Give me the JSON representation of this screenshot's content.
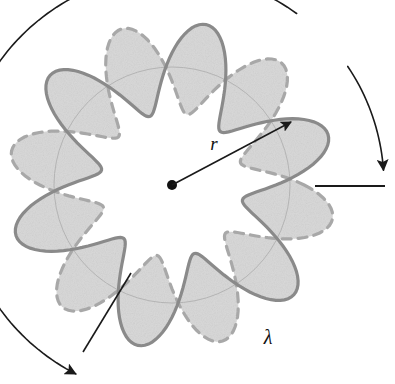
{
  "figure": {
    "canvas": {
      "width": 395,
      "height": 384,
      "background": "#ffffff"
    },
    "geometry": {
      "center": {
        "x": 172,
        "y": 185
      },
      "base_radius": 118,
      "lobe_count": 6,
      "node_count": 6,
      "wave_amplitude": 46,
      "phase_offset_deg": 27,
      "node_positions": [
        {
          "x": 110,
          "y": 78
        },
        {
          "x": 243,
          "y": 78
        },
        {
          "x": 307,
          "y": 182
        },
        {
          "x": 238,
          "y": 288
        },
        {
          "x": 110,
          "y": 292
        },
        {
          "x": 43,
          "y": 186
        }
      ]
    },
    "colors": {
      "solid_wave": "#8a8a8a",
      "dashed_wave": "#a8a8a8",
      "lobe_fill": "#d9d9d9",
      "base_circle": "#b4b4b4",
      "annotation": "#1a1a1a",
      "center_dot": "#111111",
      "background": "#ffffff"
    },
    "strokes": {
      "solid_wave_width": 3.2,
      "dashed_wave_width": 3.2,
      "dash_pattern": "9 7",
      "base_circle_width": 1.0,
      "annotation_width": 1.6
    }
  },
  "annotations": {
    "radius": {
      "label": "r",
      "name": "radius",
      "meaning": "orbit radius",
      "arrow_from": {
        "x": 172,
        "y": 185
      },
      "arrow_to": {
        "x": 291,
        "y": 122
      },
      "label_pos": {
        "x": 214,
        "y": 150
      }
    },
    "wavelength": {
      "label": "λ",
      "name": "lambda",
      "meaning": "de Broglie wavelength",
      "label_pos": {
        "x": 268,
        "y": 344
      },
      "arc_start": {
        "x": 96,
        "y": 338
      },
      "arc_end": {
        "x": 345,
        "y": 190
      },
      "tick_left": {
        "x1": 83,
        "y1": 352,
        "x2": 131,
        "y2": 273
      },
      "tick_right": {
        "x1": 315,
        "y1": 186,
        "x2": 385,
        "y2": 186
      }
    }
  },
  "center_dot": {
    "label": "orbit-center",
    "radius": 5
  },
  "caption": {
    "text": "",
    "visible": false
  },
  "chart_data": {
    "type": "line",
    "xlabel": "angle (degrees)",
    "ylabel": "radial displacement (px)",
    "grid": false,
    "legend_position": "none",
    "xlim": [
      0,
      360
    ],
    "ylim": [
      -46,
      46
    ],
    "x": [
      0,
      15,
      30,
      45,
      60,
      75,
      90,
      105,
      120,
      135,
      150,
      165,
      180,
      195,
      210,
      225,
      240,
      255,
      270,
      285,
      300,
      315,
      330,
      345,
      360
    ],
    "series": [
      {
        "name": "solid-phase",
        "style": "solid",
        "color": "#8a8a8a",
        "values": [
          0,
          23,
          39.8,
          46,
          39.8,
          23,
          0,
          -23,
          -39.8,
          -46,
          -39.8,
          -23,
          0,
          23,
          39.8,
          46,
          39.8,
          23,
          0,
          -23,
          -39.8,
          -46,
          -39.8,
          -23,
          0
        ]
      },
      {
        "name": "dashed-phase",
        "style": "dashed",
        "color": "#a8a8a8",
        "values": [
          0,
          -23,
          -39.8,
          -46,
          -39.8,
          -23,
          0,
          23,
          39.8,
          46,
          39.8,
          23,
          0,
          -23,
          -39.8,
          -46,
          -39.8,
          -23,
          0,
          23,
          39.8,
          46,
          39.8,
          23,
          0
        ]
      }
    ],
    "annotations": [
      {
        "label": "r",
        "type": "arrow",
        "meaning": "orbit radius"
      },
      {
        "label": "λ",
        "type": "arc-span",
        "meaning": "one wavelength = two lobes = 120 degrees"
      }
    ]
  }
}
